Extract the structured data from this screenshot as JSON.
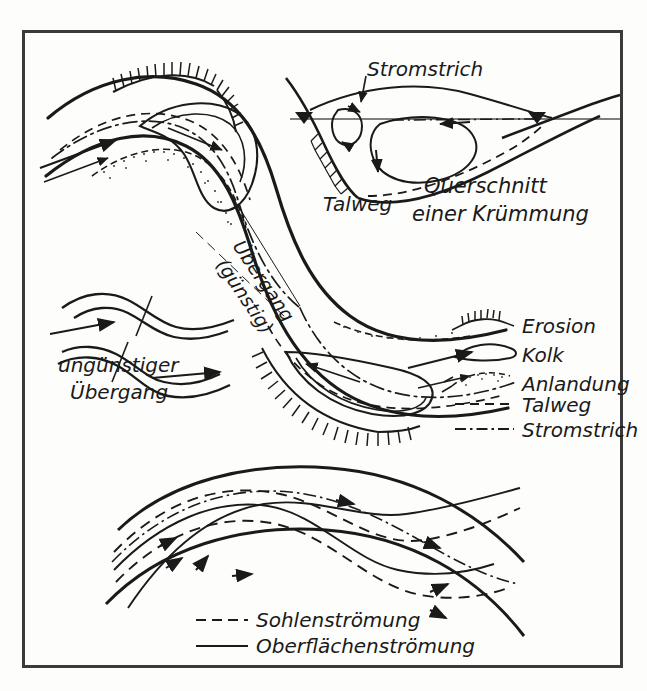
{
  "figure": {
    "type": "technical-diagram",
    "language": "de",
    "background_color": "#fdfdfb",
    "ink_color": "#1a1a1a",
    "frame": {
      "x": 22,
      "y": 30,
      "width": 600,
      "height": 637,
      "stroke": "#333333",
      "stroke_width": 3
    }
  },
  "panels": {
    "plan_view": {
      "name": "Meander plan view with erosion, Kolk, Anlandung",
      "transition_label_line1": "Übergang",
      "transition_label_line2": "(günstig)"
    },
    "cross_section": {
      "title_line1": "Querschnitt",
      "title_line2": "einer Krümmung",
      "stromstrich_label": "Stromstrich",
      "talweg_label": "Talweg"
    },
    "unfavourable": {
      "label_line1": "ungünstiger",
      "label_line2": "Übergang"
    },
    "bottom_panel": {
      "name": "Surface and bed current paths over a bend"
    }
  },
  "legend_main": {
    "items": [
      {
        "label": "Erosion",
        "symbol": "hatched-comb-line"
      },
      {
        "label": "Kolk",
        "symbol": "lens-outline"
      },
      {
        "label": "Anlandung",
        "symbol": "stippled-arc"
      },
      {
        "label": "Talweg",
        "symbol": "dashed-line"
      },
      {
        "label": "Stromstrich",
        "symbol": "dash-dot-line"
      }
    ]
  },
  "legend_bottom": {
    "items": [
      {
        "label": "Sohlenströmung",
        "symbol": "dashed-line"
      },
      {
        "label": "Oberflächenströmung",
        "symbol": "solid-line"
      }
    ]
  }
}
